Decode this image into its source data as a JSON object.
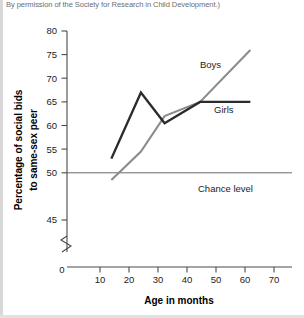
{
  "caption": {
    "text": "By permission of the Society for Research in Child Development.)"
  },
  "chart_data": {
    "type": "line",
    "title": "",
    "xlabel": "Age in months",
    "ylabel": "Percentage of social bids to same-sex peer",
    "xlim": [
      0,
      75
    ],
    "ylim": [
      43,
      81
    ],
    "xticks": [
      0,
      10,
      20,
      30,
      40,
      50,
      60,
      70
    ],
    "xtick_labels": [
      "0",
      "10",
      "20",
      "30",
      "40",
      "50",
      "60",
      "70"
    ],
    "yticks": [
      45,
      50,
      55,
      60,
      65,
      70,
      75,
      80
    ],
    "ytick_labels": [
      "45",
      "50",
      "55",
      "60",
      "65",
      "70",
      "75",
      "80"
    ],
    "grid": false,
    "axis_break": true,
    "legend_position": "inline-annotations",
    "series": [
      {
        "name": "Boys",
        "color": "#8c8c8c",
        "x": [
          15,
          25,
          33,
          45,
          62
        ],
        "values": [
          48.5,
          54.5,
          62,
          65,
          76
        ],
        "label_x": 47,
        "label_y": 71.5
      },
      {
        "name": "Girls",
        "color": "#2b2b2b",
        "x": [
          15,
          25,
          33,
          45,
          62
        ],
        "values": [
          53,
          67,
          60.5,
          65,
          65
        ],
        "label_x": 50,
        "label_y": 67.6
      }
    ],
    "annotations": [
      {
        "name": "chance-level",
        "label": "Chance level",
        "y": 50,
        "label_x": 47,
        "label_y": 51.6
      }
    ]
  }
}
